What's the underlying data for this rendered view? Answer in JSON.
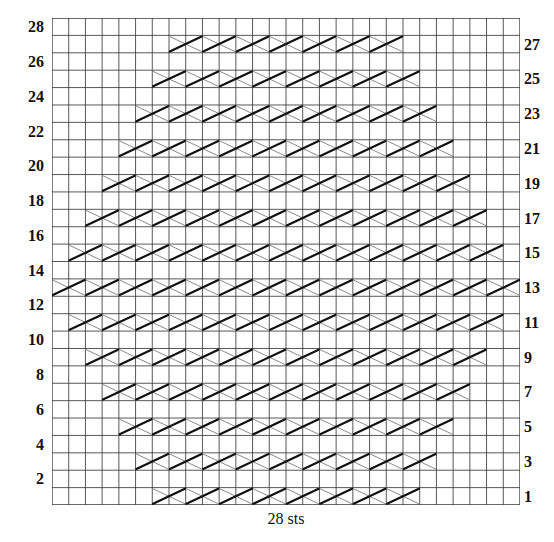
{
  "figure": {
    "title": "",
    "bottom_caption": "28 sts",
    "grid": {
      "stitches": 28,
      "rows": 28,
      "cell_width": 16.714,
      "cell_height": 17.393,
      "line_color": "#3a3a3a",
      "border_color": "#2a2a2a",
      "background": "#ffffff"
    },
    "symbol": {
      "name": "cable-cross-2x1",
      "span_cells": 2,
      "thick_color": "#111111",
      "thin_color": "#8a8a8a",
      "thick_width": 2.2,
      "thin_width": 1.0
    },
    "row_labels_left": [
      {
        "row": 28,
        "label": "28"
      },
      {
        "row": 26,
        "label": "26"
      },
      {
        "row": 24,
        "label": "24"
      },
      {
        "row": 22,
        "label": "22"
      },
      {
        "row": 20,
        "label": "20"
      },
      {
        "row": 18,
        "label": "18"
      },
      {
        "row": 16,
        "label": "16"
      },
      {
        "row": 14,
        "label": "14"
      },
      {
        "row": 12,
        "label": "12"
      },
      {
        "row": 10,
        "label": "10"
      },
      {
        "row": 8,
        "label": "8"
      },
      {
        "row": 6,
        "label": "6"
      },
      {
        "row": 4,
        "label": "4"
      },
      {
        "row": 2,
        "label": "2"
      }
    ],
    "row_labels_right": [
      {
        "row": 27,
        "label": "27"
      },
      {
        "row": 25,
        "label": "25"
      },
      {
        "row": 23,
        "label": "23"
      },
      {
        "row": 21,
        "label": "21"
      },
      {
        "row": 19,
        "label": "19"
      },
      {
        "row": 17,
        "label": "17"
      },
      {
        "row": 15,
        "label": "15"
      },
      {
        "row": 13,
        "label": "13"
      },
      {
        "row": 11,
        "label": "11"
      },
      {
        "row": 9,
        "label": "9"
      },
      {
        "row": 7,
        "label": "7"
      },
      {
        "row": 5,
        "label": "5"
      },
      {
        "row": 3,
        "label": "3"
      },
      {
        "row": 1,
        "label": "1"
      }
    ]
  },
  "chart_data": {
    "type": "heatmap",
    "xlabel": "28 sts",
    "ylabel": "rows",
    "grid": true,
    "legend": "none",
    "columns": 28,
    "rows": 28,
    "symbol_legend": [
      {
        "key": "cross",
        "label": "2-over-2 cable cross (spans 2 stitches)"
      },
      {
        "key": "empty",
        "label": "knit on RS, purl on WS"
      }
    ],
    "note": "Odd-numbered rows carry the cable-cross symbols; even-numbered rows are plain. Each cross occupies 2 stitch columns. Columns counted 1-28 from left.",
    "rows_data": [
      {
        "row": 28,
        "side": "left",
        "crosses": []
      },
      {
        "row": 27,
        "side": "right",
        "start_col": 8,
        "count": 7,
        "crosses": [
          8,
          10,
          12,
          14,
          16,
          18,
          20
        ]
      },
      {
        "row": 26,
        "side": "left",
        "crosses": []
      },
      {
        "row": 25,
        "side": "right",
        "start_col": 7,
        "count": 8,
        "crosses": [
          7,
          9,
          11,
          13,
          15,
          17,
          19,
          21
        ]
      },
      {
        "row": 24,
        "side": "left",
        "crosses": []
      },
      {
        "row": 23,
        "side": "right",
        "start_col": 6,
        "count": 9,
        "crosses": [
          6,
          8,
          10,
          12,
          14,
          16,
          18,
          20,
          22
        ]
      },
      {
        "row": 22,
        "side": "left",
        "crosses": []
      },
      {
        "row": 21,
        "side": "right",
        "start_col": 5,
        "count": 10,
        "crosses": [
          5,
          7,
          9,
          11,
          13,
          15,
          17,
          19,
          21,
          23
        ]
      },
      {
        "row": 20,
        "side": "left",
        "crosses": []
      },
      {
        "row": 19,
        "side": "right",
        "start_col": 4,
        "count": 11,
        "crosses": [
          4,
          6,
          8,
          10,
          12,
          14,
          16,
          18,
          20,
          22,
          24
        ]
      },
      {
        "row": 18,
        "side": "left",
        "crosses": []
      },
      {
        "row": 17,
        "side": "right",
        "start_col": 3,
        "count": 12,
        "crosses": [
          3,
          5,
          7,
          9,
          11,
          13,
          15,
          17,
          19,
          21,
          23,
          25
        ]
      },
      {
        "row": 16,
        "side": "left",
        "crosses": []
      },
      {
        "row": 15,
        "side": "right",
        "start_col": 2,
        "count": 13,
        "crosses": [
          2,
          4,
          6,
          8,
          10,
          12,
          14,
          16,
          18,
          20,
          22,
          24,
          26
        ]
      },
      {
        "row": 14,
        "side": "left",
        "crosses": []
      },
      {
        "row": 13,
        "side": "right",
        "start_col": 1,
        "count": 14,
        "crosses": [
          1,
          3,
          5,
          7,
          9,
          11,
          13,
          15,
          17,
          19,
          21,
          23,
          25,
          27
        ]
      },
      {
        "row": 12,
        "side": "left",
        "crosses": []
      },
      {
        "row": 11,
        "side": "right",
        "start_col": 2,
        "count": 13,
        "crosses": [
          2,
          4,
          6,
          8,
          10,
          12,
          14,
          16,
          18,
          20,
          22,
          24,
          26
        ]
      },
      {
        "row": 10,
        "side": "left",
        "crosses": []
      },
      {
        "row": 9,
        "side": "right",
        "start_col": 3,
        "count": 12,
        "crosses": [
          3,
          5,
          7,
          9,
          11,
          13,
          15,
          17,
          19,
          21,
          23,
          25
        ]
      },
      {
        "row": 8,
        "side": "left",
        "crosses": []
      },
      {
        "row": 7,
        "side": "right",
        "start_col": 4,
        "count": 11,
        "crosses": [
          4,
          6,
          8,
          10,
          12,
          14,
          16,
          18,
          20,
          22,
          24
        ]
      },
      {
        "row": 6,
        "side": "left",
        "crosses": []
      },
      {
        "row": 5,
        "side": "right",
        "start_col": 5,
        "count": 10,
        "crosses": [
          5,
          7,
          9,
          11,
          13,
          15,
          17,
          19,
          21,
          23
        ]
      },
      {
        "row": 4,
        "side": "left",
        "crosses": []
      },
      {
        "row": 3,
        "side": "right",
        "start_col": 6,
        "count": 9,
        "crosses": [
          6,
          8,
          10,
          12,
          14,
          16,
          18,
          20,
          22
        ]
      },
      {
        "row": 2,
        "side": "left",
        "crosses": []
      },
      {
        "row": 1,
        "side": "right",
        "start_col": 7,
        "count": 8,
        "crosses": [
          7,
          9,
          11,
          13,
          15,
          17,
          19,
          21
        ]
      }
    ]
  }
}
